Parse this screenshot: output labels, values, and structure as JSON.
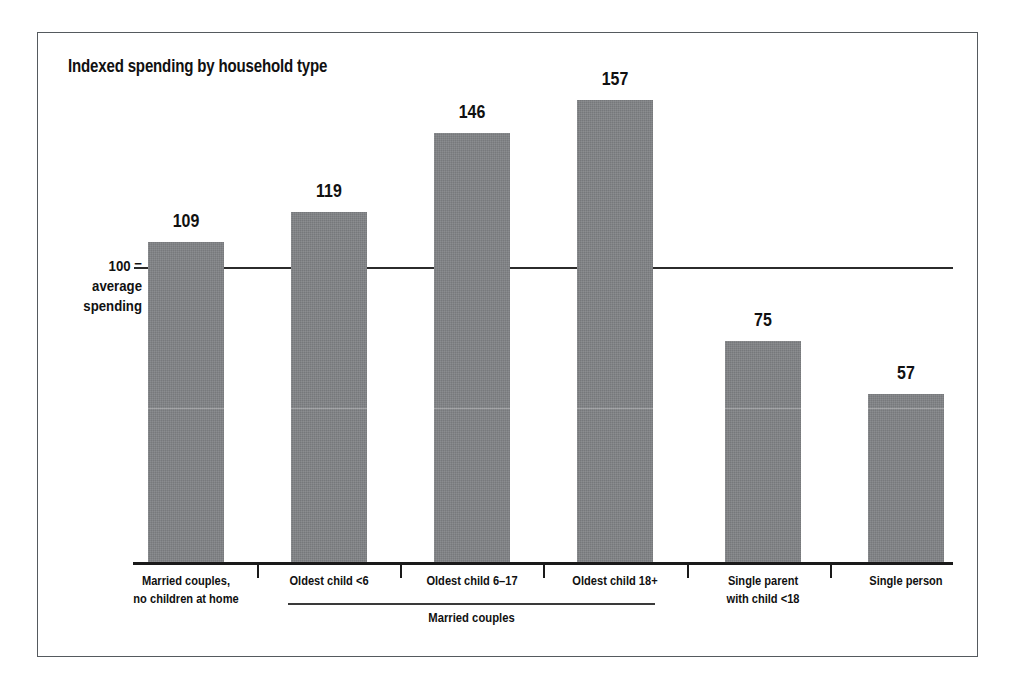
{
  "figure": {
    "title": "Indexed spending by household type",
    "y_axis_note": {
      "line1": "100 =",
      "line2": "average",
      "line3": "spending"
    },
    "group_bracket_label": "Married couples"
  },
  "chart_data": {
    "type": "bar",
    "title": "Indexed spending by household type",
    "xlabel": "",
    "ylabel": "100 = average spending",
    "categories": [
      "Married couples, no children at home",
      "Oldest child <6",
      "Oldest child 6–17",
      "Oldest child 18+",
      "Single parent with child <18",
      "Single person"
    ],
    "category_lines": [
      [
        "Married couples,",
        "no children at home"
      ],
      [
        "Oldest child <6",
        ""
      ],
      [
        "Oldest child 6–17",
        ""
      ],
      [
        "Oldest child 18+",
        ""
      ],
      [
        "Single parent",
        "with child <18"
      ],
      [
        "Single person",
        ""
      ]
    ],
    "values": [
      109,
      119,
      146,
      157,
      75,
      57
    ],
    "value_labels": [
      "109",
      "119",
      "146",
      "157",
      "75",
      "57"
    ],
    "reference_line": 100,
    "reference_line_label": "100 = average spending",
    "ylim": [
      0,
      190
    ],
    "grid": false,
    "legend": null,
    "bar_color": "#808285",
    "axis_color": "#1a1a1a",
    "groups": [
      {
        "label": "Married couples",
        "category_indexes": [
          1,
          2,
          3
        ]
      }
    ]
  },
  "colors": {
    "bar": "#808285",
    "axis": "#1a1a1a",
    "text": "#111111",
    "frame": "#555a5e",
    "background": "#ffffff"
  }
}
